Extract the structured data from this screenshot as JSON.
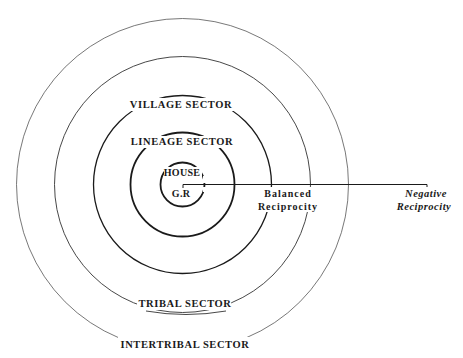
{
  "diagram": {
    "center": {
      "x": 182.5,
      "y": 184.5
    },
    "colors": {
      "background": "#ffffff",
      "stroke_dark": "#1a1a1a",
      "stroke_light": "#555555",
      "text": "#1a1a1a"
    },
    "sectors": [
      {
        "id": "house",
        "label": "HOUSE",
        "radius": 22,
        "stroke_width": 1.8
      },
      {
        "id": "lineage",
        "label": "LINEAGE SECTOR",
        "radius": 52,
        "stroke_width": 1.8
      },
      {
        "id": "village",
        "label": "VILLAGE SECTOR",
        "radius": 89,
        "stroke_width": 1.3
      },
      {
        "id": "tribal",
        "label": "TRIBAL SECTOR",
        "radius": 128,
        "stroke_width": 0.9
      },
      {
        "id": "intertribal",
        "label": "INTERTRIBAL SECTOR",
        "radius": 166,
        "stroke_width": 0.8
      }
    ],
    "center_label": "G.R",
    "axis": {
      "x_start": 183,
      "x_end": 427,
      "y": 184.5
    },
    "reciprocity": {
      "balanced": {
        "line1": "Balanced",
        "line2": "Reciprocity"
      },
      "negative": {
        "line1": "Negative",
        "line2": "Reciprocity"
      }
    }
  }
}
